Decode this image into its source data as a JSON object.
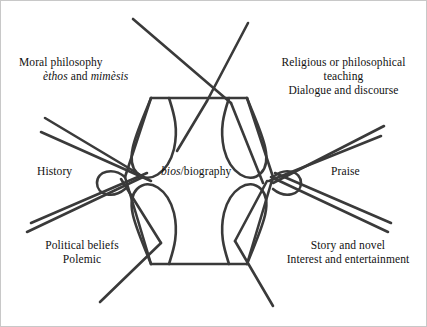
{
  "diagram": {
    "title_center": {
      "italic_part": "bios",
      "rest": "/biography"
    },
    "nodes": [
      {
        "id": "moral-philosophy",
        "position": "top-left",
        "lines": [
          "Moral philosophy",
          "èthos and mimèsis"
        ],
        "line1": "Moral philosophy",
        "line2_italic_a": "èthos",
        "line2_plain": " and ",
        "line2_italic_b": "mimèsis"
      },
      {
        "id": "religious-philosophical-teaching",
        "position": "top-right",
        "lines": [
          "Religious or philosophical",
          "teaching",
          "Dialogue and discourse"
        ],
        "line1": "Religious or philosophical",
        "line2": "teaching",
        "line3": "Dialogue and discourse"
      },
      {
        "id": "history",
        "position": "middle-left",
        "lines": [
          "History"
        ],
        "line1": "History"
      },
      {
        "id": "praise",
        "position": "middle-right",
        "lines": [
          "Praise"
        ],
        "line1": "Praise"
      },
      {
        "id": "political-beliefs",
        "position": "bottom-left",
        "lines": [
          "Political beliefs",
          "Polemic"
        ],
        "line1": "Political beliefs",
        "line2": "Polemic"
      },
      {
        "id": "story-and-novel",
        "position": "bottom-right",
        "lines": [
          "Story and novel",
          "Interest and entertainment"
        ],
        "line1": "Story and novel",
        "line2": "Interest and entertainment"
      }
    ],
    "colors": {
      "stroke": "#3a3a3a",
      "background": "#ffffff",
      "text": "#111111",
      "frame": "#c8c8c8"
    },
    "geometry": {
      "hexagon_points": "150,97 246,97 272,176 246,263 150,263 124,176",
      "stroke_width": 2.6
    }
  }
}
